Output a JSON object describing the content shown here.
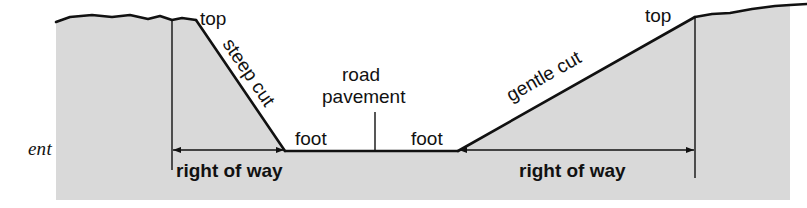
{
  "figure": {
    "type": "road-cross-section-diagram",
    "caption_fragment": "ent",
    "colors": {
      "ground_fill": "#d9d9d9",
      "line": "#111111",
      "background": "#ffffff",
      "text": "#111111"
    }
  },
  "labels": {
    "top_left": "top",
    "top_right": "top",
    "steep_cut": "steep cut",
    "gentle_cut": "gentle cut",
    "road": "road",
    "pavement": "pavement",
    "foot_left": "foot",
    "foot_right": "foot",
    "right_of_way_left": "right of way",
    "right_of_way_right": "right of way"
  },
  "geometry": {
    "road_level_y": 151,
    "left_cut": {
      "top_x": 172,
      "top_y": 20,
      "crest_end_x": 196,
      "foot_x": 285,
      "foot_y": 151,
      "slope_description": "steep"
    },
    "right_cut": {
      "foot_x": 458,
      "foot_y": 151,
      "top_x": 695,
      "top_y": 17,
      "slope_description": "gentle"
    },
    "right_of_way_left": {
      "x1": 172,
      "x2": 285,
      "y": 150
    },
    "right_of_way_right": {
      "x1": 458,
      "x2": 695,
      "y": 150
    },
    "pavement_leader": {
      "x": 375,
      "y1": 112,
      "y2": 151
    },
    "ground_extent": {
      "x1": 55,
      "x2": 790,
      "y_bottom": 200
    }
  }
}
